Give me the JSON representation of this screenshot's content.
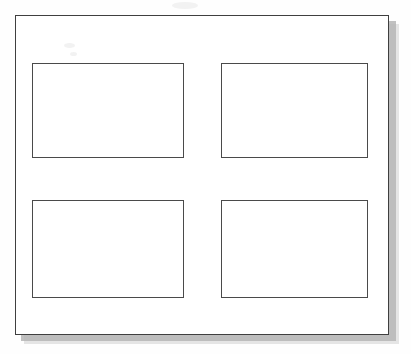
{
  "document": {
    "title": "Blank four-panel layout diagram",
    "description": "Scanned line drawing: an outer rectangular border with a drop shadow containing four empty rectangular panels arranged in a two-by-two grid.",
    "background_color": "#ffffff",
    "line_color": "#4a4a4a",
    "shadow_color": "#b6b6b6"
  },
  "frame": {
    "name": "outer-border",
    "label": "",
    "x": 15,
    "y": 15,
    "width": 374,
    "height": 320,
    "border_color": "#3f3f3f",
    "fill_color": "#ffffff",
    "has_drop_shadow": true,
    "shadow_offset_x": 6,
    "shadow_offset_y": 6
  },
  "grid": {
    "rows": 2,
    "columns": 2,
    "panel_count": 4,
    "column_gap": 37,
    "row_gap": 42
  },
  "panels": [
    {
      "id": "panel-1",
      "label": "",
      "row": 1,
      "column": 1,
      "x": 32,
      "y": 63,
      "width": 152,
      "height": 95,
      "fill_color": "#ffffff",
      "border_color": "#4a4a4a",
      "content": ""
    },
    {
      "id": "panel-2",
      "label": "",
      "row": 1,
      "column": 2,
      "x": 221,
      "y": 63,
      "width": 147,
      "height": 95,
      "fill_color": "#ffffff",
      "border_color": "#4a4a4a",
      "content": ""
    },
    {
      "id": "panel-3",
      "label": "",
      "row": 2,
      "column": 1,
      "x": 32,
      "y": 200,
      "width": 152,
      "height": 98,
      "fill_color": "#ffffff",
      "border_color": "#4a4a4a",
      "content": ""
    },
    {
      "id": "panel-4",
      "label": "",
      "row": 2,
      "column": 2,
      "x": 221,
      "y": 200,
      "width": 147,
      "height": 98,
      "fill_color": "#ffffff",
      "border_color": "#4a4a4a",
      "content": ""
    }
  ],
  "artifacts": [
    {
      "id": "smudge-1",
      "type": "scan-smudge",
      "x": 64,
      "y": 43
    },
    {
      "id": "smudge-2",
      "type": "scan-smudge",
      "x": 172,
      "y": 2
    },
    {
      "id": "smudge-3",
      "type": "scan-smudge",
      "x": 70,
      "y": 52
    }
  ]
}
